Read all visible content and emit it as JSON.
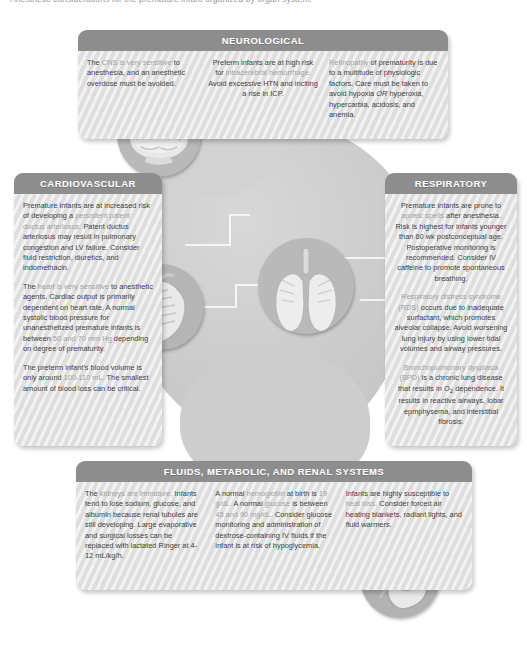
{
  "caption": "Anesthetic considerations for the premature infant organized by organ system.",
  "colors": {
    "header_bar": "#8d8d8d",
    "panel_body": "#e3e3e3",
    "body_text": "#3f3f3f",
    "highlight_text": "#9f9f9f",
    "blob": "#cfcfcf",
    "organ_circle": "#bdbdbd"
  },
  "panels": {
    "neurological": {
      "title": "NEUROLOGICAL",
      "columns": [
        [
          {
            "runs": [
              {
                "t": "The ",
                "hl": false
              },
              {
                "t": "CNS is very sensitive",
                "hl": true
              },
              {
                "t": " to anesthesia, and an anesthetic overdose must be avoided.",
                "hl": false
              }
            ]
          }
        ],
        [
          {
            "runs": [
              {
                "t": "Preterm infants are at high risk for ",
                "hl": false
              },
              {
                "t": "intracerebral hemorrhage.",
                "hl": true
              },
              {
                "t": " Avoid excessive HTN and inciting a rise in ICP.",
                "hl": false
              }
            ]
          }
        ],
        [
          {
            "runs": [
              {
                "t": "Retinopathy",
                "hl": true
              },
              {
                "t": " of prematurity is due to a multitude of physiologic factors. Care must be taken to avoid hypoxia ",
                "hl": false
              },
              {
                "t": "OR",
                "hl": false,
                "em": true
              },
              {
                "t": " hyperoxia, hypercarbia, acidosis, and anemia.",
                "hl": false
              }
            ]
          }
        ]
      ]
    },
    "cardiovascular": {
      "title": "CARDIOVASCULAR",
      "paragraphs": [
        {
          "runs": [
            {
              "t": "Premature infants are at increased risk of developing a ",
              "hl": false
            },
            {
              "t": "persistent patent ductus arteriosus.",
              "hl": true
            },
            {
              "t": " Patent ductus arteriosus may result in pulmonary congestion and LV failure. Consider fluid restriction, diuretics, and indomethacin.",
              "hl": false
            }
          ]
        },
        {
          "runs": [
            {
              "t": "The ",
              "hl": false
            },
            {
              "t": "heart is very sensitive",
              "hl": true
            },
            {
              "t": " to anesthetic agents. Cardiac output is primarily dependent on heart rate. A normal systolic blood pressure for unanesthetized premature infants is between ",
              "hl": false
            },
            {
              "t": "50 and 70 mm Hg",
              "hl": true
            },
            {
              "t": " depending on degree of prematurity.",
              "hl": false
            }
          ]
        },
        {
          "runs": [
            {
              "t": "The preterm infant's blood volume is only around ",
              "hl": false
            },
            {
              "t": "100-110 mL.",
              "hl": true
            },
            {
              "t": " The smallest amount of blood loss can be critical.",
              "hl": false
            }
          ]
        }
      ]
    },
    "respiratory": {
      "title": "RESPIRATORY",
      "paragraphs": [
        {
          "runs": [
            {
              "t": "Premature infants are prone to ",
              "hl": false
            },
            {
              "t": "apneic spells",
              "hl": true
            },
            {
              "t": " after anesthesia. Risk is highest for infants younger than 60 wk postconceptual age. Postoperative monitoring is recommended. Consider IV caffeine to promote spontaneous breathing.",
              "hl": false
            }
          ]
        },
        {
          "runs": [
            {
              "t": "Respiratory distress syndrome (RDS)",
              "hl": true
            },
            {
              "t": " occurs due to inadequate surfactant, which promotes alveolar collapse. Avoid worsening lung injury by using lower tidal volumes and airway pressures.",
              "hl": false
            }
          ]
        },
        {
          "runs": [
            {
              "t": "Bronchopulmonary dysplasia (BPD)",
              "hl": true
            },
            {
              "t": " is a chronic lung disease that results in O",
              "hl": false
            },
            {
              "t": "2",
              "hl": false,
              "sub": true
            },
            {
              "t": " dependence. It results in reactive airways, lobar epmphysema, and interstitial fibrosis.",
              "hl": false
            }
          ]
        }
      ]
    },
    "fluids": {
      "title": "FLUIDS, METABOLIC, AND RENAL SYSTEMS",
      "columns": [
        [
          {
            "runs": [
              {
                "t": "The ",
                "hl": false
              },
              {
                "t": "kidneys are immature.",
                "hl": true
              },
              {
                "t": " Infants tend to lose sodium, glucose, and albumin because renal tubules are still developing. Large evaporative and surgical losses can be replaced with lactated Ringer at 4-12 mL/kg/h.",
                "hl": false
              }
            ]
          }
        ],
        [
          {
            "runs": [
              {
                "t": "A normal ",
                "hl": false
              },
              {
                "t": "hemoglobin",
                "hl": true
              },
              {
                "t": " at birth is ",
                "hl": false
              },
              {
                "t": "19 g/dL.",
                "hl": true
              },
              {
                "t": "  A normal ",
                "hl": false
              },
              {
                "t": "glucose",
                "hl": true
              },
              {
                "t": " is between ",
                "hl": false
              },
              {
                "t": "45 and 90 mg/dL.",
                "hl": true
              },
              {
                "t": " Consider glucose monitoring and administration of dextrose-containing IV fluids if the infant is at risk of hypoglycemia.",
                "hl": false
              }
            ]
          }
        ],
        [
          {
            "runs": [
              {
                "t": "Infants are highly susceptible to ",
                "hl": false
              },
              {
                "t": "heat loss.",
                "hl": true
              },
              {
                "t": " Consider forced air heating blankets, radiant lights, and fluid warmers.",
                "hl": false
              }
            ]
          }
        ]
      ]
    }
  },
  "organs": [
    {
      "name": "brain",
      "label": "brain-illustration"
    },
    {
      "name": "heart",
      "label": "heart-illustration"
    },
    {
      "name": "lungs",
      "label": "lungs-illustration"
    },
    {
      "name": "kidney",
      "label": "kidney-illustration"
    }
  ]
}
